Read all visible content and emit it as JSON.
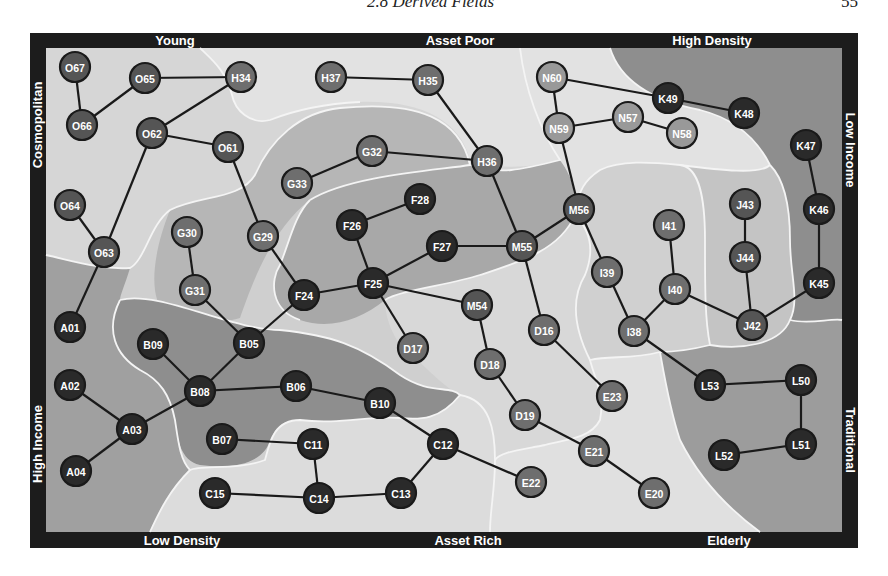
{
  "page_header": {
    "section_title": "2.8 Derived Fields",
    "page_number": "55"
  },
  "diagram": {
    "axis_labels": {
      "top": [
        "Young",
        "Asset Poor",
        "High Density"
      ],
      "bottom": [
        "Low Density",
        "Asset Rich",
        "Elderly"
      ],
      "left": [
        "Cosmopolitan",
        "High Income"
      ],
      "right": [
        "Low Income",
        "Traditional"
      ]
    },
    "colors": {
      "frame": "#1c1c1c",
      "region_lightest": "#e2e2e2",
      "region_light": "#cfcfcf",
      "region_mid": "#b4b4b4",
      "region_dark": "#9a9a9a",
      "region_darkest": "#8a8a8a",
      "region_boundary": "#f4f4f4",
      "node_dark": "#2a2a2a",
      "node_mid": "#555555",
      "node_gray": "#6e6e6e",
      "node_light": "#999999",
      "edge": "#1a1a1a",
      "node_text": "#ffffff"
    },
    "nodes": [
      {
        "id": "O67",
        "x": 75,
        "y": 67,
        "shade": "mid"
      },
      {
        "id": "O65",
        "x": 145,
        "y": 78,
        "shade": "mid"
      },
      {
        "id": "H34",
        "x": 241,
        "y": 77,
        "shade": "gray"
      },
      {
        "id": "O66",
        "x": 82,
        "y": 125,
        "shade": "mid"
      },
      {
        "id": "O62",
        "x": 152,
        "y": 133,
        "shade": "mid"
      },
      {
        "id": "O61",
        "x": 228,
        "y": 147,
        "shade": "mid"
      },
      {
        "id": "O64",
        "x": 70,
        "y": 205,
        "shade": "mid"
      },
      {
        "id": "O63",
        "x": 104,
        "y": 252,
        "shade": "mid"
      },
      {
        "id": "H37",
        "x": 331,
        "y": 77,
        "shade": "gray"
      },
      {
        "id": "H35",
        "x": 428,
        "y": 80,
        "shade": "gray"
      },
      {
        "id": "H36",
        "x": 487,
        "y": 161,
        "shade": "gray"
      },
      {
        "id": "G32",
        "x": 372,
        "y": 151,
        "shade": "gray"
      },
      {
        "id": "G33",
        "x": 297,
        "y": 183,
        "shade": "gray"
      },
      {
        "id": "G30",
        "x": 187,
        "y": 232,
        "shade": "gray"
      },
      {
        "id": "G29",
        "x": 263,
        "y": 236,
        "shade": "gray"
      },
      {
        "id": "G31",
        "x": 195,
        "y": 290,
        "shade": "gray"
      },
      {
        "id": "F28",
        "x": 420,
        "y": 199,
        "shade": "dark"
      },
      {
        "id": "F26",
        "x": 352,
        "y": 225,
        "shade": "dark"
      },
      {
        "id": "F27",
        "x": 442,
        "y": 246,
        "shade": "dark"
      },
      {
        "id": "F25",
        "x": 373,
        "y": 283,
        "shade": "dark"
      },
      {
        "id": "F24",
        "x": 304,
        "y": 295,
        "shade": "dark"
      },
      {
        "id": "M55",
        "x": 522,
        "y": 246,
        "shade": "mid"
      },
      {
        "id": "M56",
        "x": 579,
        "y": 209,
        "shade": "mid"
      },
      {
        "id": "M54",
        "x": 477,
        "y": 305,
        "shade": "mid"
      },
      {
        "id": "N60",
        "x": 552,
        "y": 77,
        "shade": "light"
      },
      {
        "id": "N59",
        "x": 559,
        "y": 128,
        "shade": "light"
      },
      {
        "id": "N57",
        "x": 628,
        "y": 117,
        "shade": "light"
      },
      {
        "id": "N58",
        "x": 682,
        "y": 133,
        "shade": "light"
      },
      {
        "id": "K49",
        "x": 668,
        "y": 98,
        "shade": "dark"
      },
      {
        "id": "K48",
        "x": 744,
        "y": 113,
        "shade": "dark"
      },
      {
        "id": "K47",
        "x": 806,
        "y": 145,
        "shade": "dark"
      },
      {
        "id": "K46",
        "x": 819,
        "y": 209,
        "shade": "dark"
      },
      {
        "id": "K45",
        "x": 819,
        "y": 283,
        "shade": "dark"
      },
      {
        "id": "J43",
        "x": 745,
        "y": 204,
        "shade": "mid"
      },
      {
        "id": "J44",
        "x": 745,
        "y": 257,
        "shade": "mid"
      },
      {
        "id": "J42",
        "x": 752,
        "y": 325,
        "shade": "mid"
      },
      {
        "id": "I41",
        "x": 669,
        "y": 225,
        "shade": "gray"
      },
      {
        "id": "I40",
        "x": 675,
        "y": 289,
        "shade": "gray"
      },
      {
        "id": "I39",
        "x": 607,
        "y": 272,
        "shade": "gray"
      },
      {
        "id": "I38",
        "x": 634,
        "y": 331,
        "shade": "gray"
      },
      {
        "id": "D16",
        "x": 544,
        "y": 330,
        "shade": "gray"
      },
      {
        "id": "D17",
        "x": 413,
        "y": 348,
        "shade": "gray"
      },
      {
        "id": "D18",
        "x": 490,
        "y": 364,
        "shade": "gray"
      },
      {
        "id": "D19",
        "x": 525,
        "y": 415,
        "shade": "gray"
      },
      {
        "id": "E23",
        "x": 612,
        "y": 396,
        "shade": "gray"
      },
      {
        "id": "E21",
        "x": 594,
        "y": 451,
        "shade": "gray"
      },
      {
        "id": "E22",
        "x": 531,
        "y": 482,
        "shade": "gray"
      },
      {
        "id": "E20",
        "x": 654,
        "y": 493,
        "shade": "gray"
      },
      {
        "id": "L53",
        "x": 710,
        "y": 385,
        "shade": "dark"
      },
      {
        "id": "L50",
        "x": 801,
        "y": 380,
        "shade": "dark"
      },
      {
        "id": "L51",
        "x": 801,
        "y": 444,
        "shade": "dark"
      },
      {
        "id": "L52",
        "x": 724,
        "y": 455,
        "shade": "dark"
      },
      {
        "id": "A01",
        "x": 70,
        "y": 327,
        "shade": "dark"
      },
      {
        "id": "A02",
        "x": 70,
        "y": 385,
        "shade": "dark"
      },
      {
        "id": "A03",
        "x": 132,
        "y": 429,
        "shade": "dark"
      },
      {
        "id": "A04",
        "x": 76,
        "y": 471,
        "shade": "dark"
      },
      {
        "id": "B09",
        "x": 153,
        "y": 344,
        "shade": "dark"
      },
      {
        "id": "B05",
        "x": 249,
        "y": 343,
        "shade": "dark"
      },
      {
        "id": "B08",
        "x": 200,
        "y": 391,
        "shade": "dark"
      },
      {
        "id": "B06",
        "x": 296,
        "y": 386,
        "shade": "dark"
      },
      {
        "id": "B10",
        "x": 380,
        "y": 403,
        "shade": "dark"
      },
      {
        "id": "B07",
        "x": 222,
        "y": 439,
        "shade": "dark"
      },
      {
        "id": "C11",
        "x": 313,
        "y": 444,
        "shade": "dark"
      },
      {
        "id": "C12",
        "x": 443,
        "y": 444,
        "shade": "dark"
      },
      {
        "id": "C15",
        "x": 215,
        "y": 493,
        "shade": "dark"
      },
      {
        "id": "C14",
        "x": 319,
        "y": 498,
        "shade": "dark"
      },
      {
        "id": "C13",
        "x": 401,
        "y": 493,
        "shade": "dark"
      }
    ],
    "edges": [
      [
        "O67",
        "O66"
      ],
      [
        "O66",
        "O65"
      ],
      [
        "O65",
        "H34"
      ],
      [
        "H34",
        "O62"
      ],
      [
        "O62",
        "O61"
      ],
      [
        "O62",
        "O63"
      ],
      [
        "O64",
        "O63"
      ],
      [
        "O63",
        "A01"
      ],
      [
        "O61",
        "G29"
      ],
      [
        "G29",
        "F24"
      ],
      [
        "G30",
        "G31"
      ],
      [
        "G31",
        "B05"
      ],
      [
        "B05",
        "F24"
      ],
      [
        "B05",
        "B08"
      ],
      [
        "B09",
        "B08"
      ],
      [
        "B08",
        "A03"
      ],
      [
        "A02",
        "A03"
      ],
      [
        "A03",
        "A04"
      ],
      [
        "B08",
        "B06"
      ],
      [
        "B06",
        "B10"
      ],
      [
        "B10",
        "C12"
      ],
      [
        "C12",
        "C13"
      ],
      [
        "C13",
        "C14"
      ],
      [
        "C14",
        "C15"
      ],
      [
        "C14",
        "C11"
      ],
      [
        "C11",
        "B07"
      ],
      [
        "C12",
        "E22"
      ],
      [
        "F24",
        "F25"
      ],
      [
        "F25",
        "F26"
      ],
      [
        "F26",
        "F28"
      ],
      [
        "F25",
        "F27"
      ],
      [
        "F25",
        "D17"
      ],
      [
        "F25",
        "M54"
      ],
      [
        "F27",
        "M55"
      ],
      [
        "M54",
        "D18"
      ],
      [
        "D18",
        "D19"
      ],
      [
        "D19",
        "E21"
      ],
      [
        "E21",
        "E20"
      ],
      [
        "M55",
        "D16"
      ],
      [
        "D16",
        "E23"
      ],
      [
        "M55",
        "H36"
      ],
      [
        "H36",
        "H35"
      ],
      [
        "H35",
        "H37"
      ],
      [
        "H36",
        "G32"
      ],
      [
        "G32",
        "G33"
      ],
      [
        "M55",
        "M56"
      ],
      [
        "M56",
        "N59"
      ],
      [
        "N59",
        "N60"
      ],
      [
        "N60",
        "K49"
      ],
      [
        "K49",
        "K48"
      ],
      [
        "N59",
        "N57"
      ],
      [
        "N57",
        "N58"
      ],
      [
        "M56",
        "I39"
      ],
      [
        "I39",
        "I38"
      ],
      [
        "I38",
        "I40"
      ],
      [
        "I40",
        "I41"
      ],
      [
        "I40",
        "J42"
      ],
      [
        "J42",
        "J44"
      ],
      [
        "J44",
        "J43"
      ],
      [
        "J42",
        "K45"
      ],
      [
        "K45",
        "K46"
      ],
      [
        "K46",
        "K47"
      ],
      [
        "I38",
        "L53"
      ],
      [
        "L53",
        "L50"
      ],
      [
        "L50",
        "L51"
      ],
      [
        "L51",
        "L52"
      ]
    ]
  }
}
